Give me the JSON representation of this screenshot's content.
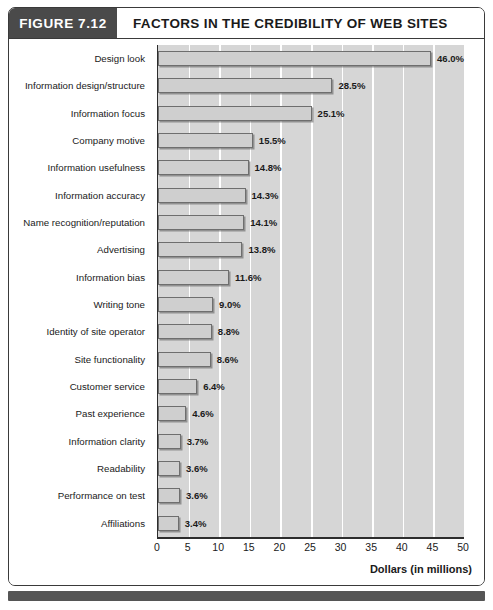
{
  "figure": {
    "number_label": "FIGURE 7.12",
    "title": "FACTORS IN THE CREDIBILITY OF WEB SITES"
  },
  "colors": {
    "header_block": "#4a4a4a",
    "plot_background": "#d6d6d6",
    "bar_fill": "#cfcfcf",
    "bar_border": "#6e6e6e",
    "gridline": "#ffffff",
    "axis": "#2d2d2d",
    "footer": "#555555",
    "text": "#1a1a1a"
  },
  "chart_data": {
    "type": "bar",
    "orientation": "horizontal",
    "title": "FACTORS IN THE CREDIBILITY OF WEB SITES",
    "subtitle": "",
    "xlabel": "Dollars (in millions)",
    "ylabel": "",
    "xlim": [
      0,
      50
    ],
    "xticks": [
      0,
      5,
      10,
      15,
      20,
      25,
      30,
      35,
      40,
      45,
      50
    ],
    "xtick_labels": [
      "0",
      "5",
      "10",
      "15",
      "20",
      "25",
      "30",
      "35",
      "40",
      "45",
      "50"
    ],
    "grid": true,
    "grid_axis": "x",
    "legend": false,
    "value_label_suffix": "%",
    "categories": [
      "Design look",
      "Information design/structure",
      "Information focus",
      "Company motive",
      "Information usefulness",
      "Information accuracy",
      "Name recognition/reputation",
      "Advertising",
      "Information bias",
      "Writing tone",
      "Identity of site operator",
      "Site functionality",
      "Customer service",
      "Past experience",
      "Information clarity",
      "Readability",
      "Performance on test",
      "Affiliations"
    ],
    "values": [
      46.0,
      28.5,
      25.1,
      15.5,
      14.8,
      14.3,
      14.1,
      13.8,
      11.6,
      9.0,
      8.8,
      8.6,
      6.4,
      4.6,
      3.7,
      3.6,
      3.6,
      3.4
    ],
    "value_labels": [
      "46.0%",
      "28.5%",
      "25.1%",
      "15.5%",
      "14.8%",
      "14.3%",
      "14.1%",
      "13.8%",
      "11.6%",
      "9.0%",
      "8.8%",
      "8.6%",
      "6.4%",
      "4.6%",
      "3.7%",
      "3.6%",
      "3.6%",
      "3.4%"
    ]
  }
}
